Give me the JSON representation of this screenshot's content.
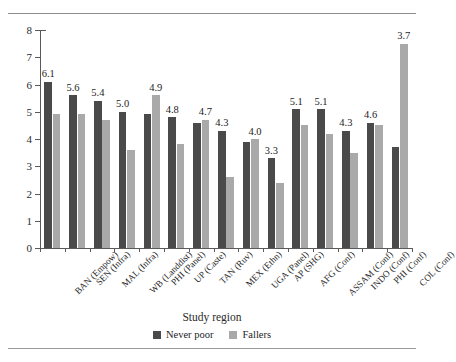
{
  "page": {
    "clipped_heading_top": "",
    "clipped_footnote_bottom": ""
  },
  "chart_data": {
    "type": "bar",
    "title": "",
    "xlabel": "Study region",
    "ylabel": "Average step on ladder of power and rights",
    "ylim": [
      0,
      8
    ],
    "yticks": [
      "0",
      "1",
      "2",
      "3",
      "4",
      "5",
      "6",
      "7",
      "8"
    ],
    "grid": false,
    "legend_position": "bottom",
    "categories": [
      "BAN (Empow)",
      "SEN (Infra)",
      "MAL (Infra)",
      "WB (Landdist)",
      "PHI (Panel)",
      "UP (Caste)",
      "TAN (Ruv)",
      "MEX (Ethn)",
      "UGA (Panel)",
      "AP (SHG)",
      "AFG (Conf)",
      "ASSAM (Conf)",
      "INDO (Conf)",
      "PHI (Conf)",
      "COL (Conf)"
    ],
    "series": [
      {
        "name": "Never poor",
        "color": "#4a4a4a",
        "values": [
          6.1,
          5.6,
          5.4,
          5.0,
          4.9,
          4.8,
          4.6,
          4.3,
          3.9,
          3.3,
          5.1,
          5.1,
          4.3,
          4.6,
          3.7
        ]
      },
      {
        "name": "Fallers",
        "color": "#a9a9a9",
        "values": [
          4.9,
          4.9,
          4.7,
          3.6,
          5.6,
          3.8,
          4.7,
          2.6,
          4.0,
          2.4,
          4.5,
          4.2,
          3.5,
          4.5,
          7.5
        ]
      }
    ],
    "data_labels": [
      "6.1",
      "5.6",
      "5.4",
      "5.0",
      "4.9",
      "4.8",
      "4.7",
      "4.3",
      "4.0",
      "3.3",
      "5.1",
      "5.1",
      "4.3",
      "4.6",
      "3.7"
    ],
    "data_label_target": [
      "dark",
      "dark",
      "dark",
      "dark",
      "light",
      "dark",
      "light",
      "dark",
      "light",
      "dark",
      "dark",
      "dark",
      "dark",
      "dark",
      "light"
    ]
  },
  "legend": {
    "items": [
      {
        "label": "Never poor",
        "color": "#4a4a4a"
      },
      {
        "label": "Fallers",
        "color": "#a9a9a9"
      }
    ]
  }
}
